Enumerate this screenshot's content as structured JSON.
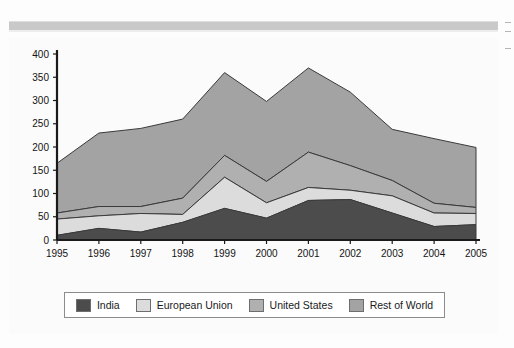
{
  "chart_data": {
    "type": "area",
    "stacked": true,
    "title": "",
    "xlabel": "",
    "ylabel": "",
    "categories": [
      "1995",
      "1996",
      "1997",
      "1998",
      "1999",
      "2000",
      "2001",
      "2002",
      "2003",
      "2004",
      "2005"
    ],
    "ylim": [
      0,
      400
    ],
    "yticks": [
      0,
      50,
      100,
      150,
      200,
      250,
      300,
      350,
      400
    ],
    "grid": false,
    "legend_position": "bottom",
    "series": [
      {
        "name": "India",
        "color": "#4c4c4c",
        "values": [
          10,
          25,
          17,
          38,
          68,
          47,
          85,
          87,
          58,
          29,
          33
        ]
      },
      {
        "name": "European Union",
        "color": "#dcdcdc",
        "values": [
          35,
          27,
          40,
          17,
          67,
          33,
          28,
          20,
          37,
          29,
          24
        ]
      },
      {
        "name": "United States",
        "color": "#b0b0b0",
        "values": [
          13,
          20,
          15,
          35,
          47,
          46,
          76,
          53,
          33,
          21,
          13
        ]
      },
      {
        "name": "Rest of World",
        "color": "#a3a3a3",
        "values": [
          107,
          158,
          168,
          170,
          178,
          172,
          181,
          158,
          110,
          139,
          129
        ]
      }
    ],
    "cumulative_tops": {
      "india": [
        10,
        25,
        17,
        38,
        68,
        47,
        85,
        87,
        58,
        29,
        33
      ],
      "european_union": [
        45,
        52,
        57,
        55,
        135,
        80,
        113,
        107,
        95,
        58,
        57
      ],
      "united_states": [
        58,
        72,
        72,
        90,
        182,
        126,
        189,
        160,
        128,
        79,
        70
      ],
      "total": [
        165,
        230,
        240,
        260,
        360,
        298,
        370,
        318,
        238,
        218,
        199
      ]
    }
  },
  "legend": {
    "items": [
      {
        "label": "India",
        "color": "#4c4c4c"
      },
      {
        "label": "European Union",
        "color": "#dcdcdc"
      },
      {
        "label": "United States",
        "color": "#b0b0b0"
      },
      {
        "label": "Rest of World",
        "color": "#a3a3a3"
      }
    ]
  },
  "axis": {
    "y_ticks": [
      "0",
      "50",
      "100",
      "150",
      "200",
      "250",
      "300",
      "350",
      "400"
    ],
    "x_ticks": [
      "1995",
      "1996",
      "1997",
      "1998",
      "1999",
      "2000",
      "2001",
      "2002",
      "2003",
      "2004",
      "2005"
    ]
  },
  "colors": {
    "axis_line": "#1a1a1a",
    "series_outline": "#3a3a3a",
    "background": "#fbfbfb",
    "band": "#c9c9c9"
  }
}
